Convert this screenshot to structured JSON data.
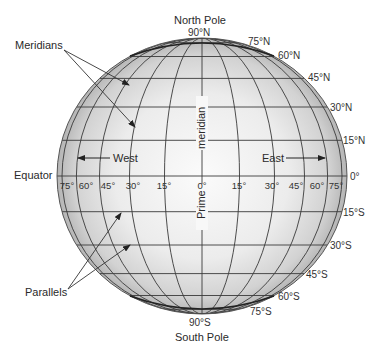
{
  "diagram": {
    "type": "globe-latitude-longitude",
    "colors": {
      "background": "#ffffff",
      "globe_center": "#fafafa",
      "globe_edge": "#b8b8b8",
      "grid_line": "#3a3a3a",
      "text": "#2a2a2a"
    },
    "poles": {
      "north": {
        "name": "North Pole",
        "lat": "90°N"
      },
      "south": {
        "name": "South Pole",
        "lat": "90°S"
      }
    },
    "callouts": {
      "meridians": "Meridians",
      "parallels": "Parallels",
      "equator": "Equator",
      "prime_meridian_top": "meridian",
      "prime_meridian_bottom": "Prime"
    },
    "directions": {
      "west": "West",
      "east": "East"
    },
    "parallel_labels_north": [
      "75°N",
      "60°N",
      "45°N",
      "30°N",
      "15°N"
    ],
    "equator_label": "0°",
    "parallel_labels_south": [
      "15°S",
      "30°S",
      "45°S",
      "60°S",
      "75°S"
    ],
    "meridian_labels_west": [
      "75°",
      "60°",
      "45°",
      "30°",
      "15°"
    ],
    "meridian_label_prime": "0°",
    "meridian_labels_east": [
      "15°",
      "30°",
      "45°",
      "60°",
      "75°"
    ],
    "latitudes_drawn": [
      75,
      60,
      45,
      30,
      15,
      0,
      -15,
      -30,
      -45,
      -60,
      -75
    ],
    "longitudes_drawn": [
      -75,
      -60,
      -45,
      -30,
      -15,
      0,
      15,
      30,
      45,
      60,
      75
    ]
  }
}
